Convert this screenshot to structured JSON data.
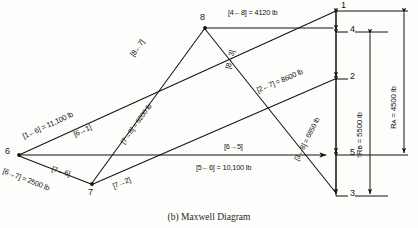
{
  "figure": {
    "caption": "(b) Maxwell Diagram",
    "type": "maxwell-force-diagram",
    "ink_color": "#15130f",
    "background": "#fdfdfc"
  },
  "nodes": [
    {
      "id": "1",
      "label": "1",
      "x": 339,
      "y": 9
    },
    {
      "id": "4",
      "label": "4",
      "x": 339,
      "y": 32
    },
    {
      "id": "8",
      "label": "8",
      "x": 205,
      "y": 28
    },
    {
      "id": "2",
      "label": "2",
      "x": 339,
      "y": 79
    },
    {
      "id": "6",
      "label": "6",
      "x": 17,
      "y": 155
    },
    {
      "id": "5",
      "label": "5",
      "x": 339,
      "y": 155
    },
    {
      "id": "7",
      "label": "7",
      "x": 92,
      "y": 185
    },
    {
      "id": "3",
      "label": "3",
      "x": 339,
      "y": 196
    }
  ],
  "members": [
    {
      "name": "4-8",
      "label": "[4←8] = 4120 lb",
      "value": 4120,
      "unit": "lb",
      "from": "8",
      "to": "4"
    },
    {
      "name": "8-7",
      "label": "[8←7]",
      "from": "7",
      "to": "8"
    },
    {
      "name": "7-8",
      "label": "[7→8] = 6200 lb",
      "value": 6200,
      "unit": "lb",
      "from": "7",
      "to": "8"
    },
    {
      "name": "1-6",
      "label": "[1←6] = 11,100 lb",
      "value": 11100,
      "unit": "lb",
      "from": "6",
      "to": "1"
    },
    {
      "name": "6-1",
      "label": "[6→1]",
      "from": "6",
      "to": "1"
    },
    {
      "name": "8-3",
      "label": "[8→3]",
      "from": "8",
      "to": "3"
    },
    {
      "name": "3-8",
      "label": "[3←8] = 6850 lb",
      "value": 6850,
      "unit": "lb",
      "from": "8",
      "to": "3"
    },
    {
      "name": "2-7",
      "label": "[2←7] = 8600 lb",
      "value": 8600,
      "unit": "lb",
      "from": "7",
      "to": "2"
    },
    {
      "name": "7-2",
      "label": "[7→2]",
      "from": "7",
      "to": "2"
    },
    {
      "name": "7-6",
      "label": "[7←6]",
      "from": "6",
      "to": "7"
    },
    {
      "name": "6-7",
      "label": "[6→7] = 2500 lb",
      "value": 2500,
      "unit": "lb",
      "from": "6",
      "to": "7"
    },
    {
      "name": "6-5",
      "label": "[6→5]",
      "from": "6",
      "to": "5"
    },
    {
      "name": "5-6",
      "label": "[5←6] = 10,100 lb",
      "value": 10100,
      "unit": "lb",
      "from": "6",
      "to": "5"
    }
  ],
  "reactions": [
    {
      "name": "R_B",
      "label": "↑Rʙ = 5500 lb",
      "symbol": "R",
      "subscript": "B",
      "value": 5500,
      "unit": "lb"
    },
    {
      "name": "R_A",
      "label": "Rᴀ = 4500 lb",
      "symbol": "R",
      "subscript": "A",
      "value": 4500,
      "unit": "lb"
    }
  ],
  "reaction_text": {
    "rb_prefix": "↑R",
    "rb_sub": "B",
    "rb_value": " = 5500 lb",
    "ra_prefix": "R",
    "ra_sub": "A",
    "ra_value": " = 4500 lb"
  }
}
